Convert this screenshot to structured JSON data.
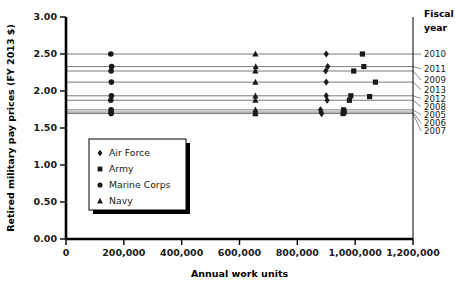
{
  "chart_data": {
    "type": "scatter",
    "title": "",
    "xlabel": "Annual work units",
    "ylabel": "Retired military pay prices (FY 2013 $)",
    "xlim": [
      0,
      1200000
    ],
    "ylim": [
      0,
      3.0
    ],
    "xticks": [
      0,
      200000,
      400000,
      600000,
      800000,
      1000000,
      1200000
    ],
    "xticklabels": [
      "0",
      "200,000",
      "400,000",
      "600,000",
      "800,000",
      "1,000,000",
      "1,200,000"
    ],
    "yticks": [
      0.0,
      0.5,
      1.0,
      1.5,
      2.0,
      2.5,
      3.0
    ],
    "yticklabels": [
      "0.00",
      "0.50",
      "1.00",
      "1.50",
      "2.00",
      "2.50",
      "3.00"
    ],
    "grid": false,
    "legend_position": "lower-left-inside",
    "legend_entries": [
      {
        "name": "Air Force",
        "marker": "diamond"
      },
      {
        "name": "Army",
        "marker": "square"
      },
      {
        "name": "Marine Corps",
        "marker": "circle"
      },
      {
        "name": "Navy",
        "marker": "triangle"
      }
    ],
    "right_axis_label": "Fiscal\nyear",
    "right_axis_header_line1": "Fiscal",
    "right_axis_header_line2": "year",
    "fiscal_year_lines": [
      {
        "year": "2010",
        "price": 2.5,
        "label_y_value": 2.5
      },
      {
        "year": "2011",
        "price": 2.33,
        "label_y_value": 2.3
      },
      {
        "year": "2009",
        "price": 2.27,
        "label_y_value": 2.15
      },
      {
        "year": "2013",
        "price": 2.12,
        "label_y_value": 2.02
      },
      {
        "year": "2012",
        "price": 1.935,
        "label_y_value": 1.9
      },
      {
        "year": "2008",
        "price": 1.875,
        "label_y_value": 1.79
      },
      {
        "year": "2005",
        "price": 1.745,
        "label_y_value": 1.68
      },
      {
        "year": "2006",
        "price": 1.715,
        "label_y_value": 1.57
      },
      {
        "year": "2007",
        "price": 1.695,
        "label_y_value": 1.46
      }
    ],
    "series": [
      {
        "name": "Air Force",
        "marker": "diamond",
        "points": [
          {
            "year": "2010",
            "x": 900000,
            "y": 2.5
          },
          {
            "year": "2011",
            "x": 905000,
            "y": 2.33
          },
          {
            "year": "2009",
            "x": 898000,
            "y": 2.27
          },
          {
            "year": "2013",
            "x": 900000,
            "y": 2.12
          },
          {
            "year": "2012",
            "x": 900000,
            "y": 1.935
          },
          {
            "year": "2008",
            "x": 903000,
            "y": 1.875
          },
          {
            "year": "2005",
            "x": 880000,
            "y": 1.745
          },
          {
            "year": "2006",
            "x": 882000,
            "y": 1.715
          },
          {
            "year": "2007",
            "x": 884000,
            "y": 1.695
          }
        ]
      },
      {
        "name": "Army",
        "marker": "square",
        "points": [
          {
            "year": "2010",
            "x": 1025000,
            "y": 2.5
          },
          {
            "year": "2011",
            "x": 1030000,
            "y": 2.33
          },
          {
            "year": "2009",
            "x": 995000,
            "y": 2.27
          },
          {
            "year": "2013",
            "x": 1070000,
            "y": 2.12
          },
          {
            "year": "2012",
            "x": 985000,
            "y": 1.935
          },
          {
            "year": "2008",
            "x": 980000,
            "y": 1.875
          },
          {
            "year": "2012b",
            "x": 1050000,
            "y": 1.925
          },
          {
            "year": "2005",
            "x": 960000,
            "y": 1.745
          },
          {
            "year": "2006",
            "x": 962000,
            "y": 1.715
          },
          {
            "year": "2007",
            "x": 958000,
            "y": 1.695
          }
        ]
      },
      {
        "name": "Marine Corps",
        "marker": "circle",
        "points": [
          {
            "year": "2010",
            "x": 155000,
            "y": 2.5
          },
          {
            "year": "2011",
            "x": 158000,
            "y": 2.33
          },
          {
            "year": "2009",
            "x": 156000,
            "y": 2.27
          },
          {
            "year": "2013",
            "x": 157000,
            "y": 2.12
          },
          {
            "year": "2012",
            "x": 157000,
            "y": 1.935
          },
          {
            "year": "2008",
            "x": 155000,
            "y": 1.875
          },
          {
            "year": "2005",
            "x": 156000,
            "y": 1.745
          },
          {
            "year": "2006",
            "x": 156000,
            "y": 1.715
          },
          {
            "year": "2007",
            "x": 156000,
            "y": 1.695
          }
        ]
      },
      {
        "name": "Navy",
        "marker": "triangle",
        "points": [
          {
            "year": "2010",
            "x": 655000,
            "y": 2.5
          },
          {
            "year": "2011",
            "x": 656000,
            "y": 2.33
          },
          {
            "year": "2009",
            "x": 655000,
            "y": 2.27
          },
          {
            "year": "2013",
            "x": 655000,
            "y": 2.12
          },
          {
            "year": "2012",
            "x": 655000,
            "y": 1.935
          },
          {
            "year": "2008",
            "x": 655000,
            "y": 1.875
          },
          {
            "year": "2005",
            "x": 655000,
            "y": 1.745
          },
          {
            "year": "2006",
            "x": 655000,
            "y": 1.715
          },
          {
            "year": "2007",
            "x": 655000,
            "y": 1.695
          }
        ]
      }
    ]
  },
  "colors": {
    "marker": "#1a1a1a",
    "axis": "#000000",
    "line": "#7a7a7a",
    "text": "#1a1a1a",
    "background": "#ffffff"
  }
}
